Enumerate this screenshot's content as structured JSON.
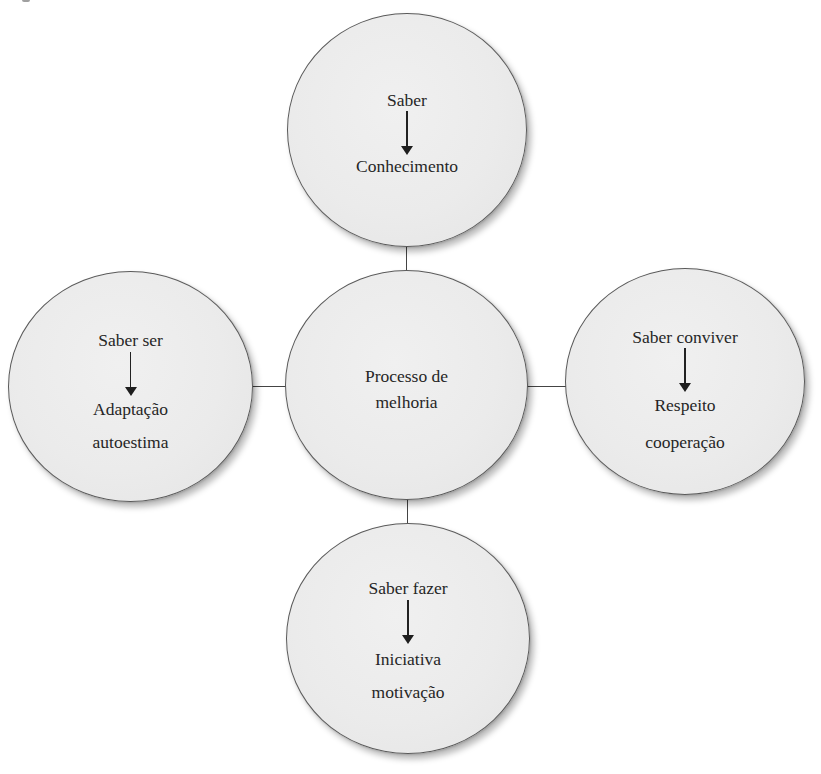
{
  "diagram": {
    "center": {
      "lines": [
        "Processo de",
        "melhoria"
      ]
    },
    "nodes": {
      "top": {
        "heading": "Saber",
        "outcome_lines": [
          "Conhecimento"
        ]
      },
      "left": {
        "heading": "Saber ser",
        "outcome_lines": [
          "Adaptação",
          "autoestima"
        ]
      },
      "right": {
        "heading": "Saber conviver",
        "outcome_lines": [
          "Respeito",
          "cooperação"
        ]
      },
      "bottom": {
        "heading": "Saber fazer",
        "outcome_lines": [
          "Iniciativa",
          "motivação"
        ]
      }
    },
    "icons": {
      "arrow": "arrow-down-icon"
    },
    "colors": {
      "circle_fill": "#ebebeb",
      "circle_border": "#5a5a5a",
      "connector": "#444444",
      "text": "#262626"
    }
  }
}
